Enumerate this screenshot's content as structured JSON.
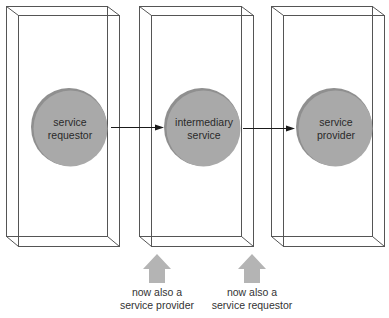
{
  "diagram": {
    "title": "",
    "colors": {
      "box_stroke": "#555555",
      "node_fill": "#a8a8a8",
      "node_rim": "#8a8a8a",
      "flow_arrow": "#1a1a1a",
      "up_arrow": "#b4b4b4",
      "text": "#2a2a2a"
    },
    "nodes": [
      {
        "id": "requestor",
        "line1": "service",
        "line2": "requestor"
      },
      {
        "id": "intermediary",
        "line1": "intermediary",
        "line2": "service"
      },
      {
        "id": "provider",
        "line1": "service",
        "line2": "provider"
      }
    ],
    "edges": [
      {
        "from": "requestor",
        "to": "intermediary",
        "type": "arrow"
      },
      {
        "from": "intermediary",
        "to": "provider",
        "type": "arrow"
      }
    ],
    "annotations": [
      {
        "icon": "up-arrow-icon",
        "line1": "now also a",
        "line2": "service provider",
        "points_to": "intermediary (left side)"
      },
      {
        "icon": "up-arrow-icon",
        "line1": "now also a",
        "line2": "service requestor",
        "points_to": "intermediary (right side)"
      }
    ]
  }
}
